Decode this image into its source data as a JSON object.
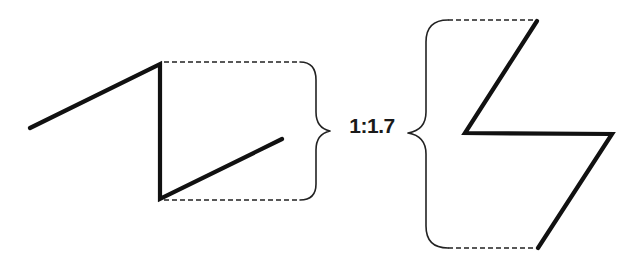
{
  "diagram": {
    "ratio_label": "1:1.7",
    "colors": {
      "stroke": "#111111",
      "dashed": "#222222",
      "background": "#ffffff"
    },
    "left_shape": {
      "description": "Z-shaped zigzag, shorter height",
      "points": [
        [
          30,
          128
        ],
        [
          160,
          64
        ],
        [
          160,
          199
        ],
        [
          282,
          139
        ]
      ],
      "height_span": [
        63,
        200
      ]
    },
    "right_shape": {
      "description": "Mirrored lightning-bolt zigzag, taller height",
      "points": [
        [
          537,
          21
        ],
        [
          465,
          133
        ],
        [
          612,
          134
        ],
        [
          538,
          248
        ]
      ],
      "height_span": [
        20,
        248
      ]
    }
  }
}
